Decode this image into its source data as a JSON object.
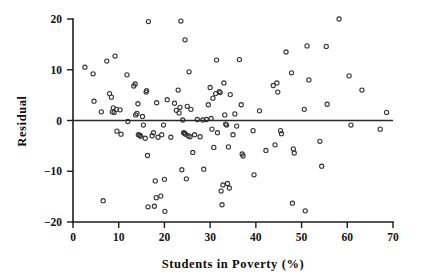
{
  "chart_data": {
    "type": "scatter",
    "title": "",
    "xlabel": "Students in Poverty (%)",
    "ylabel": "Residual",
    "xlim": [
      0,
      70
    ],
    "ylim": [
      -20,
      20
    ],
    "xticks": [
      0,
      10,
      20,
      30,
      40,
      50,
      60,
      70
    ],
    "yticks": [
      -20,
      -10,
      0,
      10,
      20
    ],
    "xtick_labels": [
      "0",
      "10",
      "20",
      "30",
      "40",
      "50",
      "60",
      "70"
    ],
    "ytick_labels": [
      "-20",
      "-10",
      "0",
      "10",
      "20"
    ],
    "grid": false,
    "legend": null,
    "reference_lines": [
      {
        "orientation": "horizontal",
        "y": 0,
        "style": "solid",
        "color": "#2a2a2a"
      }
    ],
    "marker": {
      "shape": "circle",
      "filled": false,
      "size": 3.0,
      "edge_color": "#353535"
    },
    "series": [
      {
        "name": "residuals",
        "points": [
          [
            2.6,
            10.5
          ],
          [
            4.4,
            9.2
          ],
          [
            4.6,
            3.8
          ],
          [
            6.2,
            1.7
          ],
          [
            6.6,
            -15.8
          ],
          [
            7.4,
            11.7
          ],
          [
            8.0,
            5.3
          ],
          [
            8.4,
            4.6
          ],
          [
            8.6,
            1.7
          ],
          [
            8.8,
            2.5
          ],
          [
            9.0,
            1.6
          ],
          [
            9.2,
            12.7
          ],
          [
            9.5,
            2.2
          ],
          [
            9.6,
            -2.1
          ],
          [
            10.3,
            2.1
          ],
          [
            10.5,
            -2.7
          ],
          [
            11.8,
            9.0
          ],
          [
            12.0,
            -0.2
          ],
          [
            13.3,
            6.8
          ],
          [
            13.6,
            7.2
          ],
          [
            13.7,
            1.1
          ],
          [
            14.0,
            1.4
          ],
          [
            14.2,
            3.3
          ],
          [
            14.3,
            -2.8
          ],
          [
            14.6,
            -2.9
          ],
          [
            14.8,
            -3.1
          ],
          [
            15.2,
            0.8
          ],
          [
            15.4,
            -0.9
          ],
          [
            15.8,
            -3.5
          ],
          [
            16.0,
            5.6
          ],
          [
            16.1,
            5.9
          ],
          [
            16.3,
            -6.9
          ],
          [
            16.4,
            -17.0
          ],
          [
            16.5,
            19.5
          ],
          [
            17.3,
            -3.0
          ],
          [
            17.6,
            -2.4
          ],
          [
            17.8,
            -16.9
          ],
          [
            18.0,
            -11.9
          ],
          [
            18.2,
            -15.2
          ],
          [
            18.3,
            3.5
          ],
          [
            18.6,
            -3.3
          ],
          [
            19.2,
            -14.9
          ],
          [
            19.4,
            -2.8
          ],
          [
            19.8,
            -0.9
          ],
          [
            20.0,
            -11.6
          ],
          [
            20.1,
            -17.9
          ],
          [
            20.6,
            4.1
          ],
          [
            21.4,
            -3.3
          ],
          [
            22.2,
            3.4
          ],
          [
            22.6,
            2.0
          ],
          [
            23.0,
            6.0
          ],
          [
            23.2,
            1.5
          ],
          [
            23.4,
            2.6
          ],
          [
            23.6,
            19.6
          ],
          [
            23.8,
            -9.7
          ],
          [
            24.0,
            0.1
          ],
          [
            24.2,
            -2.4
          ],
          [
            24.4,
            -2.5
          ],
          [
            24.5,
            15.9
          ],
          [
            24.6,
            -2.7
          ],
          [
            24.8,
            -11.5
          ],
          [
            25.0,
            2.8
          ],
          [
            25.2,
            -3.0
          ],
          [
            25.4,
            9.6
          ],
          [
            25.6,
            -3.2
          ],
          [
            25.8,
            2.2
          ],
          [
            26.2,
            -6.3
          ],
          [
            26.6,
            -2.8
          ],
          [
            27.2,
            0.2
          ],
          [
            27.8,
            -3.2
          ],
          [
            28.4,
            0.1
          ],
          [
            28.6,
            -9.6
          ],
          [
            29.2,
            0.2
          ],
          [
            29.6,
            3.1
          ],
          [
            30.0,
            6.5
          ],
          [
            30.2,
            0.4
          ],
          [
            30.4,
            -1.7
          ],
          [
            30.6,
            4.4
          ],
          [
            30.8,
            -5.3
          ],
          [
            31.2,
            5.3
          ],
          [
            31.4,
            11.9
          ],
          [
            31.6,
            -2.4
          ],
          [
            32.0,
            5.7
          ],
          [
            32.2,
            5.5
          ],
          [
            32.4,
            -13.9
          ],
          [
            32.6,
            -16.6
          ],
          [
            32.8,
            -12.7
          ],
          [
            33.0,
            7.4
          ],
          [
            33.2,
            1.1
          ],
          [
            33.4,
            -0.7
          ],
          [
            33.6,
            -0.9
          ],
          [
            33.8,
            -12.4
          ],
          [
            34.0,
            -5.2
          ],
          [
            34.2,
            -13.3
          ],
          [
            34.4,
            5.1
          ],
          [
            35.0,
            -2.8
          ],
          [
            35.4,
            1.3
          ],
          [
            35.8,
            -1.1
          ],
          [
            36.4,
            12.0
          ],
          [
            36.8,
            3.1
          ],
          [
            37.0,
            -6.6
          ],
          [
            37.2,
            -7.0
          ],
          [
            39.4,
            -2.0
          ],
          [
            39.6,
            -10.7
          ],
          [
            40.8,
            1.9
          ],
          [
            42.2,
            -5.9
          ],
          [
            43.8,
            6.9
          ],
          [
            44.2,
            -4.8
          ],
          [
            44.6,
            7.4
          ],
          [
            44.8,
            5.6
          ],
          [
            45.4,
            -2.0
          ],
          [
            45.6,
            -2.6
          ],
          [
            46.6,
            13.5
          ],
          [
            47.8,
            9.4
          ],
          [
            48.0,
            -16.3
          ],
          [
            48.2,
            -5.6
          ],
          [
            48.4,
            -6.4
          ],
          [
            50.6,
            2.2
          ],
          [
            50.8,
            -17.8
          ],
          [
            51.2,
            14.7
          ],
          [
            51.6,
            8.0
          ],
          [
            54.0,
            -4.1
          ],
          [
            54.4,
            -9.0
          ],
          [
            55.4,
            14.6
          ],
          [
            55.6,
            3.2
          ],
          [
            58.2,
            20.0
          ],
          [
            60.4,
            8.8
          ],
          [
            60.8,
            -0.9
          ],
          [
            63.2,
            6.0
          ],
          [
            67.2,
            -1.7
          ],
          [
            68.6,
            1.6
          ]
        ]
      }
    ]
  },
  "axis_titles": {
    "x": "Students in Poverty (%)",
    "y": "Residual"
  }
}
